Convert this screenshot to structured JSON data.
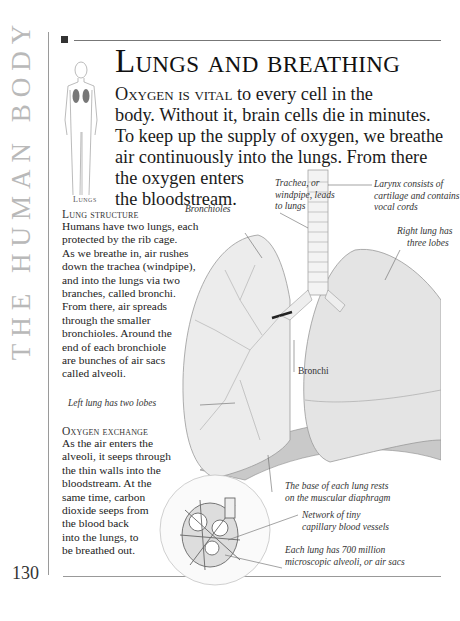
{
  "spine": {
    "text": "THE HUMAN BODY"
  },
  "page_number": "130",
  "thumbnail": {
    "label": "Lungs",
    "icon": "human-figure-lungs-icon"
  },
  "title": "Lungs and breathing",
  "lead": {
    "caps": "Oxygen is vital",
    "lines": [
      " to every cell in the",
      "body. Without it, brain cells die in minutes.",
      "To keep up the supply of oxygen, we breathe",
      "air continuously into the lungs. From there",
      "the oxygen enters",
      "the bloodstream."
    ]
  },
  "sections": [
    {
      "heading": "Lung structure",
      "lines": [
        "Humans have two lungs, each",
        "protected by the rib cage.",
        "As we breathe in, air rushes",
        "down the trachea (windpipe),",
        "and into the lungs via two",
        "branches, called bronchi.",
        "From there, air spreads",
        "through the smaller",
        "bronchioles. Around the",
        "end of each bronchiole",
        "are bunches of air sacs",
        "called alveoli."
      ]
    },
    {
      "heading": "Oxygen exchange",
      "lines": [
        "As the air enters the",
        "alveoli, it seeps through",
        "the thin walls into the",
        "bloodstream. At the",
        "same time, carbon",
        "dioxide seeps from",
        "the blood back",
        "into the lungs, to",
        "be breathed out."
      ]
    }
  ],
  "captions": {
    "trachea": [
      "Trachea, or",
      "windpipe, leads",
      "to lungs"
    ],
    "bronchioles": [
      "Bronchioles"
    ],
    "larynx": [
      "Larynx consists of",
      "cartilage and contains",
      "vocal cords"
    ],
    "right_lung": [
      "Right lung has",
      "three lobes"
    ],
    "bronchi": [
      "Bronchi"
    ],
    "left_lung": [
      "Left lung has two lobes"
    ],
    "diaphragm": [
      "The base of each lung rests",
      "on the muscular diaphragm"
    ],
    "capillaries": [
      "Network of tiny",
      "capillary blood vessels"
    ],
    "alveoli": [
      "Each lung has 700 million",
      "microscopic alveoli, or air sacs"
    ]
  },
  "colors": {
    "spine": "#b9b9b9",
    "marker": "#333333",
    "text": "#1a1a1a",
    "illustration_stroke": "#8a8a8a"
  }
}
